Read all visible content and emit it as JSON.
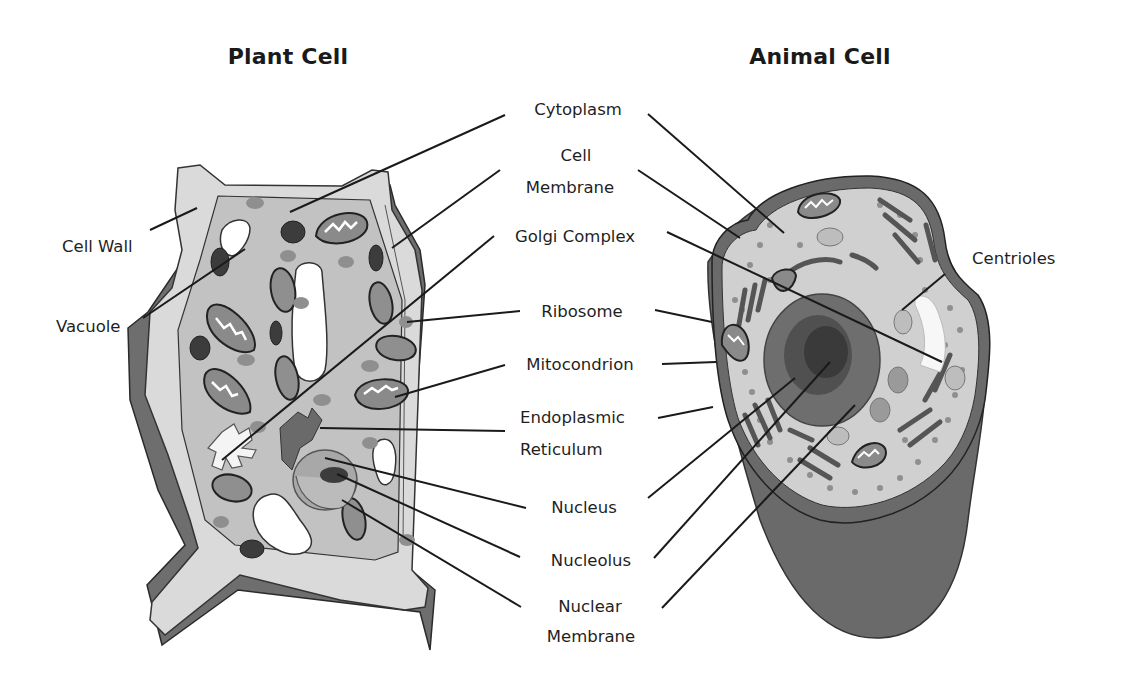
{
  "titles": {
    "plant": "Plant Cell",
    "animal": "Animal Cell"
  },
  "labels": {
    "cytoplasm": "Cytoplasm",
    "cell_membrane_1": "Cell",
    "cell_membrane_2": "Membrane",
    "golgi_complex": "Golgi Complex",
    "ribosome": "Ribosome",
    "mitocondrion": "Mitocondrion",
    "er_1": "Endoplasmic",
    "er_2": "Reticulum",
    "nucleus": "Nucleus",
    "nucleolus": "Nucleolus",
    "nuclear_membrane_1": "Nuclear",
    "nuclear_membrane_2": "Membrane",
    "cell_wall": "Cell Wall",
    "vacuole": "Vacuole",
    "centrioles": "Centrioles"
  },
  "colors": {
    "background": "#ffffff",
    "wall_light": "#d9d9d9",
    "wall_dark": "#6e6e6e",
    "cytoplasm": "#c4c4c4",
    "animal_cytoplasm": "#d0d0d0",
    "animal_membrane": "#6a6a6a",
    "organelle_dark": "#3c3c3c",
    "organelle_mid": "#8a8a8a",
    "ribosome": "#8f8f8f",
    "nucleus": "#9a9a9a",
    "nucleus_dark": "#555555",
    "text": "#1a1a1a"
  }
}
